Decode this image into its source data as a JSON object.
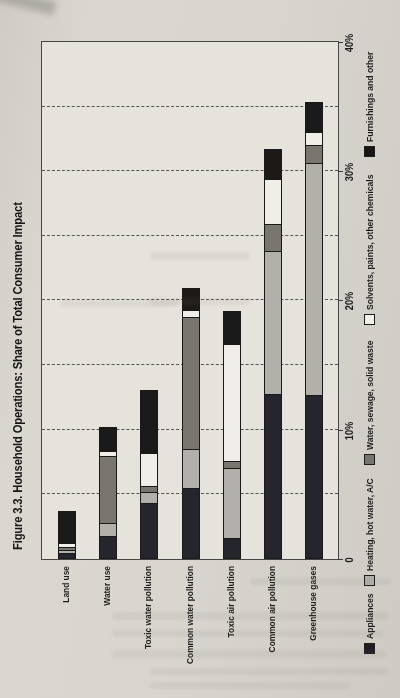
{
  "figure": {
    "title": "Figure 3.3. Household Operations: Share of Total Consumer Impact"
  },
  "chart_data": {
    "type": "bar",
    "subtype": "stacked-horizontal",
    "page_rotation": "chart printed rotated 90 degrees counterclockwise on portrait page",
    "title": "Figure 3.3. Household Operations: Share of Total Consumer Impact",
    "categories": [
      "Land use",
      "Water use",
      "Toxic water pollution",
      "Common water pollution",
      "Toxic air pollution",
      "Common air pollution",
      "Greenhouse gases"
    ],
    "series": [
      {
        "name": "Appliances",
        "color": "#25252e",
        "swatch": "#1d1d24",
        "values": [
          0.5,
          1.8,
          4.3,
          5.5,
          1.6,
          12.8,
          12.7
        ]
      },
      {
        "name": "Heating, hot water, A/C",
        "color": "#b2b0ab",
        "swatch": "#b3b1ac",
        "values": [
          0.3,
          1.1,
          1.0,
          3.1,
          5.5,
          11.1,
          18.0
        ]
      },
      {
        "name": "Water, sewage, solid waste",
        "color": "#797670",
        "swatch": "#77756f",
        "values": [
          0.3,
          5.2,
          0.5,
          10.3,
          0.6,
          2.2,
          1.5
        ]
      },
      {
        "name": "Solvents, paints, other chemicals",
        "color": "#f0eee8",
        "swatch": "#f2f0ea",
        "values": [
          0.4,
          0.5,
          2.6,
          0.6,
          9.2,
          3.5,
          1.1
        ]
      },
      {
        "name": "Furnishings and other",
        "color": "#1a1a1a",
        "swatch": "#161616",
        "values": [
          2.5,
          1.9,
          5.0,
          1.8,
          2.6,
          2.4,
          2.4
        ]
      }
    ],
    "totals_pct": [
      4.0,
      10.5,
      13.4,
      21.3,
      19.5,
      32.0,
      35.7
    ],
    "xlabel": "",
    "ylabel": "",
    "axis": {
      "min": 0,
      "max": 40,
      "tick_values": [
        0,
        10,
        20,
        30,
        40
      ],
      "tick_labels": [
        "0",
        "10%",
        "20%",
        "30%",
        "40%"
      ],
      "gridline_interval_pct": 5,
      "gridline_style": "dashed"
    },
    "legend_position": "bottom"
  }
}
